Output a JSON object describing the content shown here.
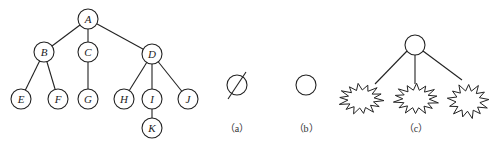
{
  "figure": {
    "tree": {
      "nodes": [
        {
          "id": "A",
          "label": "A",
          "x": 88,
          "y": 19
        },
        {
          "id": "B",
          "label": "B",
          "x": 44,
          "y": 52
        },
        {
          "id": "C",
          "label": "C",
          "x": 88,
          "y": 52
        },
        {
          "id": "D",
          "label": "D",
          "x": 152,
          "y": 54
        },
        {
          "id": "E",
          "label": "E",
          "x": 21,
          "y": 99
        },
        {
          "id": "F",
          "label": "F",
          "x": 58,
          "y": 99
        },
        {
          "id": "G",
          "label": "G",
          "x": 88,
          "y": 99
        },
        {
          "id": "H",
          "label": "H",
          "x": 124,
          "y": 99
        },
        {
          "id": "I",
          "label": "I",
          "x": 152,
          "y": 99
        },
        {
          "id": "J",
          "label": "J",
          "x": 188,
          "y": 99
        },
        {
          "id": "K",
          "label": "K",
          "x": 152,
          "y": 128
        }
      ],
      "edges": [
        [
          "A",
          "B"
        ],
        [
          "A",
          "C"
        ],
        [
          "A",
          "D"
        ],
        [
          "B",
          "E"
        ],
        [
          "B",
          "F"
        ],
        [
          "C",
          "G"
        ],
        [
          "D",
          "H"
        ],
        [
          "D",
          "I"
        ],
        [
          "D",
          "J"
        ],
        [
          "I",
          "K"
        ]
      ]
    },
    "panels": [
      {
        "id": "a",
        "caption": "（a）",
        "description": "empty tree symbol"
      },
      {
        "id": "b",
        "caption": "（b）",
        "description": "single node"
      },
      {
        "id": "c",
        "caption": "（c）",
        "description": "root with subtrees"
      }
    ]
  }
}
